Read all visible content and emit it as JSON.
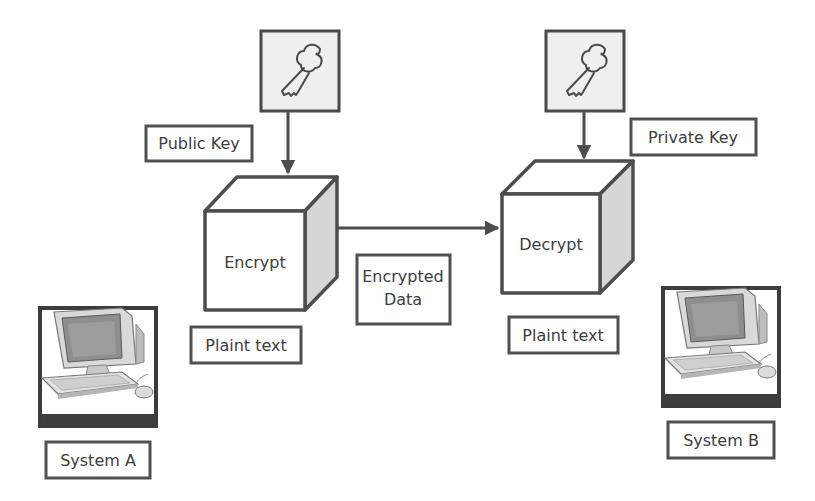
{
  "diagram": {
    "keys": {
      "public_label": "Public Key",
      "private_label": "Private Key",
      "icon": "key-icon"
    },
    "processes": {
      "encrypt": "Encrypt",
      "decrypt": "Decrypt"
    },
    "data_labels": {
      "plaintext_a": "Plaint text",
      "plaintext_b": "Plaint text",
      "encrypted_line1": "Encrypted",
      "encrypted_line2": "Data"
    },
    "systems": {
      "a": "System A",
      "b": "System B",
      "icon": "computer-icon"
    },
    "colors": {
      "stroke": "#4d4d4d",
      "cube_side": "#d6d6d6",
      "key_box_fill": "#efefef",
      "text": "#3d3d3d"
    }
  }
}
